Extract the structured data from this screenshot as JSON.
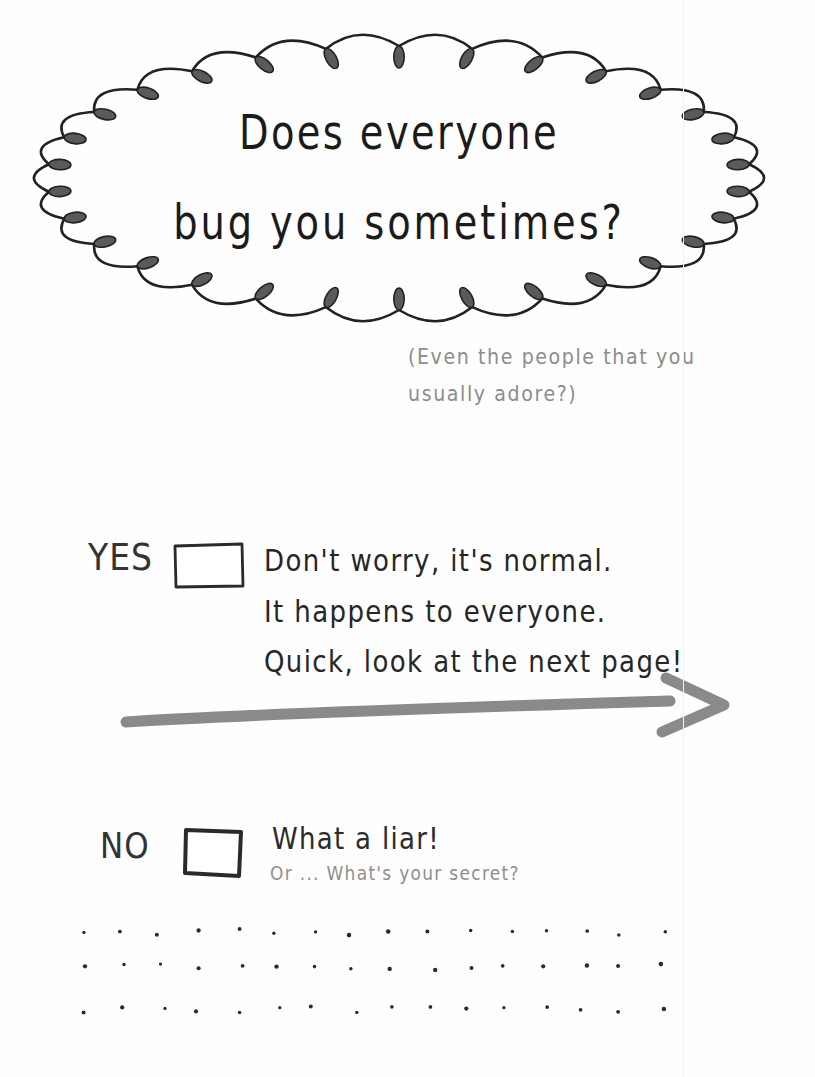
{
  "bubble": {
    "line1": "Does everyone",
    "line2": "bug you sometimes?"
  },
  "subnote": {
    "line1": "(Even the people that you",
    "line2": "usually adore?)"
  },
  "yes": {
    "label": "YES",
    "checkbox_checked": false,
    "lines": [
      "Don't worry, it's normal.",
      "It happens to everyone.",
      "Quick, look at the next page!"
    ]
  },
  "no": {
    "label": "NO",
    "checkbox_checked": false,
    "line1": "What a liar!",
    "line2": "Or ... What's your secret?"
  },
  "arrow": {
    "icon": "arrow-right-icon",
    "color": "#8a8a8a",
    "direction": "right"
  },
  "decoration": {
    "dots_rows": 3,
    "dots_per_row": 16,
    "dot_color": "#2b2b2b"
  },
  "colors": {
    "ink": "#1b1b1b",
    "light_ink": "#8c8c8c",
    "arrow_gray": "#8a8a8a",
    "paper": "#fefefe"
  }
}
